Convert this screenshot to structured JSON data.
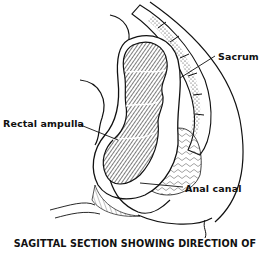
{
  "figure": {
    "labels": [
      {
        "id": "sacrum",
        "text": "Sacrum"
      },
      {
        "id": "rectal_ampulla",
        "text": "Rectal ampulla"
      },
      {
        "id": "anal_canal",
        "text": "Anal canal"
      }
    ],
    "caption": "SAGITTAL SECTION SHOWING DIRECTION OF",
    "colors": {
      "ink": "#111111",
      "background": "#ffffff"
    }
  }
}
